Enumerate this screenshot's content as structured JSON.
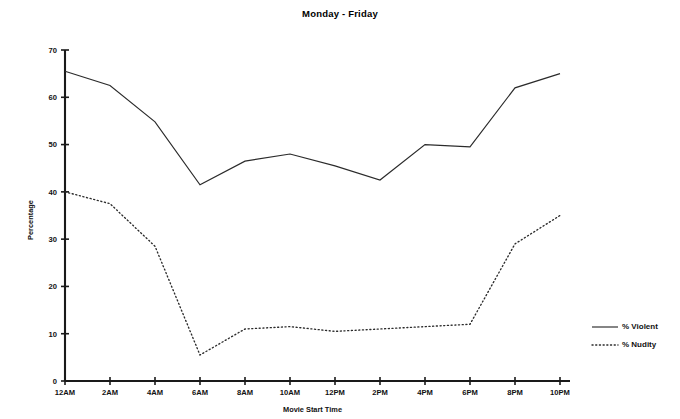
{
  "chart_data": {
    "type": "line",
    "title": "Monday - Friday",
    "xlabel": "Movie Start Time",
    "ylabel": "Percentage",
    "grid": false,
    "legend_position": "right",
    "categories": [
      "12AM",
      "2AM",
      "4AM",
      "6AM",
      "8AM",
      "10AM",
      "12PM",
      "2PM",
      "4PM",
      "6PM",
      "8PM",
      "10PM"
    ],
    "x_tick_labels": [
      "12AM",
      "2AM",
      "4AM",
      "6AM",
      "8AM",
      "10AM",
      "12PM",
      "2PM",
      "4PM",
      "6PM",
      "8PM",
      "10PM"
    ],
    "y_tick_labels": [
      "0",
      "10",
      "20",
      "30",
      "40",
      "50",
      "60",
      "70"
    ],
    "y_ticks": [
      0,
      10,
      20,
      30,
      40,
      50,
      60,
      70
    ],
    "ylim": [
      0,
      70
    ],
    "xlim": [
      0,
      11
    ],
    "series": [
      {
        "name": "% Violent",
        "style": "solid",
        "values": [
          65.5,
          62.5,
          54.8,
          41.5,
          46.5,
          48.0,
          45.5,
          42.5,
          50.0,
          49.5,
          62.0,
          65.0
        ]
      },
      {
        "name": "% Nudity",
        "style": "dotted",
        "values": [
          40.0,
          37.5,
          28.5,
          5.5,
          11.0,
          11.5,
          10.5,
          11.0,
          11.5,
          12.0,
          29.0,
          35.0
        ]
      }
    ],
    "legend": [
      {
        "label": "% Violent",
        "style": "solid"
      },
      {
        "label": "% Nudity",
        "style": "dotted"
      }
    ]
  }
}
